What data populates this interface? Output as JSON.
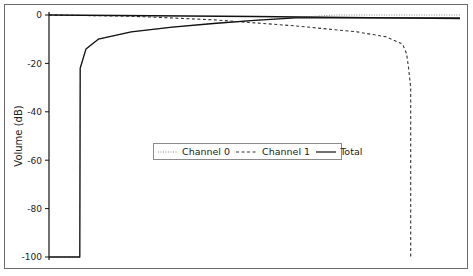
{
  "chart_data": {
    "type": "line",
    "title": "",
    "xlabel": "",
    "ylabel": "Volume (dB)",
    "ylim": [
      -100,
      0
    ],
    "yticks": [
      0,
      -20,
      -40,
      -60,
      -80,
      -100
    ],
    "ytick_labels": [
      "0",
      "-20",
      "-40",
      "-60",
      "-80",
      "-100"
    ],
    "xticks": [],
    "grid": false,
    "legend_position": "center",
    "series": [
      {
        "name": "Channel 0",
        "style": "dotted",
        "points": [
          [
            0.0,
            -100
          ],
          [
            0.075,
            -100
          ],
          [
            0.076,
            -22
          ],
          [
            0.09,
            -14
          ],
          [
            0.12,
            -10
          ],
          [
            0.2,
            -7
          ],
          [
            0.3,
            -5
          ],
          [
            0.4,
            -3.5
          ],
          [
            0.5,
            -2.2
          ],
          [
            0.6,
            -1
          ],
          [
            0.7,
            0
          ],
          [
            1.0,
            0
          ]
        ]
      },
      {
        "name": "Channel 1",
        "style": "dashed",
        "points": [
          [
            0.0,
            0
          ],
          [
            0.2,
            -0.5
          ],
          [
            0.4,
            -2
          ],
          [
            0.6,
            -4.5
          ],
          [
            0.75,
            -7
          ],
          [
            0.82,
            -9
          ],
          [
            0.86,
            -12
          ],
          [
            0.87,
            -16
          ],
          [
            0.875,
            -22
          ],
          [
            0.88,
            -30
          ],
          [
            0.88,
            -100
          ]
        ]
      },
      {
        "name": "Total",
        "style": "solid",
        "points": [
          [
            0.0,
            -100
          ],
          [
            0.075,
            -100
          ],
          [
            0.076,
            -22
          ],
          [
            0.09,
            -14
          ],
          [
            0.12,
            -10
          ],
          [
            0.2,
            -7
          ],
          [
            0.3,
            -5
          ],
          [
            0.4,
            -3.5
          ],
          [
            0.5,
            -2.2
          ],
          [
            0.6,
            -1.2
          ],
          [
            0.7,
            -1.2
          ],
          [
            1.0,
            -1.2
          ]
        ]
      },
      {
        "name": "Total (upper)",
        "style": "solid",
        "points": [
          [
            0.0,
            0
          ],
          [
            0.5,
            -0.6
          ],
          [
            1.0,
            -1.5
          ]
        ]
      }
    ]
  },
  "legend": {
    "items": [
      {
        "label": "Channel 0"
      },
      {
        "label": "Channel 1"
      },
      {
        "label": "Total"
      }
    ]
  },
  "axis": {
    "ylabel": "Volume (dB)",
    "ticks": [
      "0",
      "-20",
      "-40",
      "-60",
      "-80",
      "-100"
    ]
  }
}
